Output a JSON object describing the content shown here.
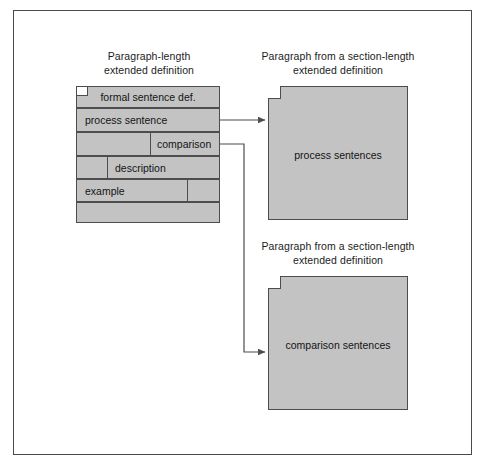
{
  "figure": {
    "background_color": "#ffffff",
    "frame_color": "#4a4a4a",
    "block_fill": "#c3c3c3",
    "block_stroke": "#4d4d4d",
    "text_color": "#141414"
  },
  "captions": {
    "left": "Paragraph-length\nextended definition",
    "right_top": "Paragraph from a section-length\nextended definition",
    "right_bottom": "Paragraph from a section-length\nextended definition"
  },
  "left_stack": {
    "rows": [
      {
        "label": "formal sentence def.",
        "label_align": "center"
      },
      {
        "label": "process sentence",
        "label_align": "left"
      },
      {
        "label": "comparison",
        "label_align": "right-cell"
      },
      {
        "label": "description",
        "label_align": "mid-cell"
      },
      {
        "label": "example",
        "label_align": "left"
      },
      {
        "label": "",
        "label_align": "none"
      }
    ]
  },
  "right_boxes": [
    {
      "label": "process sentences"
    },
    {
      "label": "comparison sentences"
    }
  ],
  "connectors": [
    {
      "from": "process sentence",
      "to": "process sentences"
    },
    {
      "from": "comparison",
      "to": "comparison sentences"
    }
  ]
}
